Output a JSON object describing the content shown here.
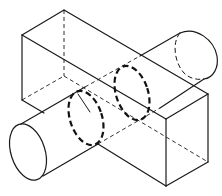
{
  "figure": {
    "description": "Isometric line drawing of a cylinder passing diagonally through a rectangular prism, showing the hidden dashed intersection curves",
    "stroke_color": "#1a1a1a",
    "background": "#ffffff",
    "objects": [
      {
        "name": "rectangular-prism",
        "style": "solid outline with dashed hidden edges"
      },
      {
        "name": "cylinder",
        "style": "solid outline with dashed hidden end ellipse"
      },
      {
        "name": "intersection-curves",
        "style": "heavy dashed ellipses",
        "count": 2
      }
    ]
  }
}
